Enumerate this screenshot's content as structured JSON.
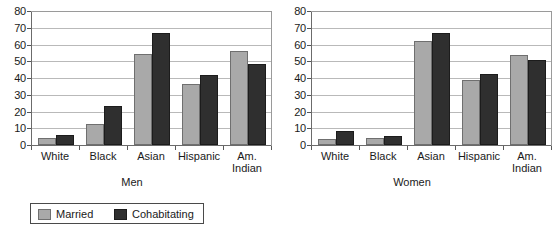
{
  "chart_data": [
    {
      "type": "bar",
      "title": "",
      "xlabel": "Men",
      "ylabel": "",
      "categories": [
        "White",
        "Black",
        "Asian",
        "Hispanic",
        "Am.\nIndian"
      ],
      "series": [
        {
          "name": "Married",
          "color": "#a9a9a9",
          "values": [
            4,
            12.5,
            54.5,
            36.5,
            56
          ]
        },
        {
          "name": "Cohabitating",
          "color": "#2f2f2f",
          "values": [
            6,
            23.5,
            67,
            42,
            48.5
          ]
        }
      ],
      "ylim": [
        0,
        80
      ],
      "yticks": [
        0,
        10,
        20,
        30,
        40,
        50,
        60,
        70,
        80
      ],
      "grid": true,
      "legend_position": "below-figure"
    },
    {
      "type": "bar",
      "title": "",
      "xlabel": "Women",
      "ylabel": "",
      "categories": [
        "White",
        "Black",
        "Asian",
        "Hispanic",
        "Am.\nIndian"
      ],
      "series": [
        {
          "name": "Married",
          "color": "#a9a9a9",
          "values": [
            3.5,
            4,
            62,
            39,
            54
          ]
        },
        {
          "name": "Cohabitating",
          "color": "#2f2f2f",
          "values": [
            8.5,
            5.5,
            67,
            42.5,
            51
          ]
        }
      ],
      "ylim": [
        0,
        80
      ],
      "yticks": [
        0,
        10,
        20,
        30,
        40,
        50,
        60,
        70,
        80
      ],
      "grid": true,
      "legend_position": "below-figure"
    }
  ],
  "panels": [
    {
      "name": "men",
      "axis_title": "Men",
      "yticks": [
        "80",
        "70",
        "60",
        "50",
        "40",
        "30",
        "20",
        "10",
        "0"
      ],
      "categories": [
        "White",
        "Black",
        "Asian",
        "Hispanic",
        "Am.\nIndian"
      ]
    },
    {
      "name": "women",
      "axis_title": "Women",
      "yticks": [
        "80",
        "70",
        "60",
        "50",
        "40",
        "30",
        "20",
        "10",
        "0"
      ],
      "categories": [
        "White",
        "Black",
        "Asian",
        "Hispanic",
        "Am.\nIndian"
      ]
    }
  ],
  "legend": {
    "entries": [
      {
        "label": "Married",
        "color": "#a9a9a9"
      },
      {
        "label": "Cohabitating",
        "color": "#2f2f2f"
      }
    ]
  }
}
